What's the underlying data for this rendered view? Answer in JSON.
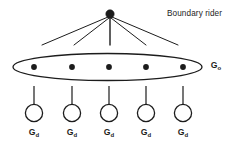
{
  "diagram": {
    "title_label": "Boundary rider",
    "overlay_group": {
      "base": "G",
      "sub": "o"
    },
    "leaf_groups": [
      {
        "base": "G",
        "sub": "d"
      },
      {
        "base": "G",
        "sub": "d"
      },
      {
        "base": "G",
        "sub": "d"
      },
      {
        "base": "G",
        "sub": "d"
      },
      {
        "base": "G",
        "sub": "d"
      }
    ],
    "colors": {
      "stroke": "#1c1c1c",
      "node_fill": "#1c1c1c",
      "leaf_fill": "#ffffff",
      "background": "#ffffff",
      "text": "#1c1c1c"
    },
    "geometry": {
      "root_node": {
        "cx": 110,
        "cy": 14,
        "r": 4.2
      },
      "ellipse": {
        "cx": 107.5,
        "cy": 67,
        "rx": 94.5,
        "ry": 13.5
      },
      "member_node_r": 2.9,
      "member_nodes_x": [
        34,
        72,
        109,
        146,
        183
      ],
      "member_nodes_y": 67,
      "leaf_circle_r": 8.6,
      "leaf_circles_y": 113,
      "fan_end_y": 45,
      "fan_end_x": [
        42,
        74,
        110,
        146,
        178
      ],
      "connector_top_y": 86,
      "connector_bottom_y": 104
    }
  }
}
